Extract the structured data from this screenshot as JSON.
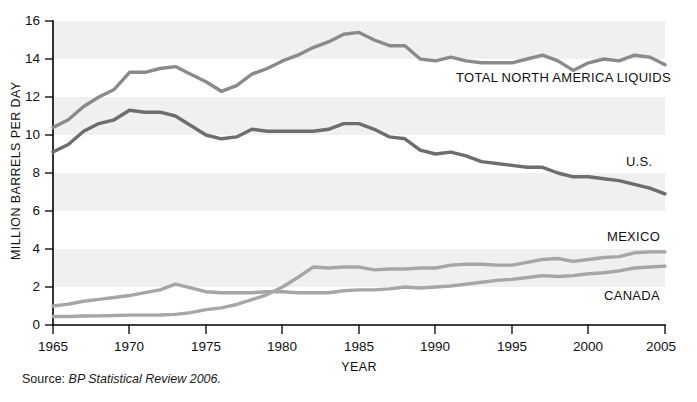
{
  "chart_data": {
    "type": "line",
    "title": "",
    "xlabel": "YEAR",
    "ylabel": "MILLION BARRELS PER DAY",
    "xlim": [
      1965,
      2005
    ],
    "ylim": [
      0,
      16
    ],
    "xticks": [
      1965,
      1970,
      1975,
      1980,
      1985,
      1990,
      1995,
      2000,
      2005
    ],
    "yticks": [
      0,
      2,
      4,
      6,
      8,
      10,
      12,
      14,
      16
    ],
    "grid": false,
    "bands": "alternating light-gray horizontal bands between 2-4, 6-8, 10-12, 14-16",
    "legend_position": "inline labels at right end of each series",
    "x": [
      1965,
      1966,
      1967,
      1968,
      1969,
      1970,
      1971,
      1972,
      1973,
      1974,
      1975,
      1976,
      1977,
      1978,
      1979,
      1980,
      1981,
      1982,
      1983,
      1984,
      1985,
      1986,
      1987,
      1988,
      1989,
      1990,
      1991,
      1992,
      1993,
      1994,
      1995,
      1996,
      1997,
      1998,
      1999,
      2000,
      2001,
      2002,
      2003,
      2004,
      2005
    ],
    "series": [
      {
        "name": "TOTAL NORTH AMERICA LIQUIDS",
        "color": "#8a8a8a",
        "width": 3.4,
        "values": [
          10.4,
          10.8,
          11.5,
          12.0,
          12.4,
          13.3,
          13.3,
          13.5,
          13.6,
          13.2,
          12.8,
          12.3,
          12.6,
          13.2,
          13.5,
          13.9,
          14.2,
          14.6,
          14.9,
          15.3,
          15.4,
          15.0,
          14.7,
          14.7,
          14.0,
          13.9,
          14.1,
          13.9,
          13.8,
          13.8,
          13.8,
          14.0,
          14.2,
          13.9,
          13.4,
          13.8,
          14.0,
          13.9,
          14.2,
          14.1,
          13.7
        ]
      },
      {
        "name": "U.S.",
        "color": "#6d6d6d",
        "width": 3.4,
        "values": [
          9.1,
          9.5,
          10.2,
          10.6,
          10.8,
          11.3,
          11.2,
          11.2,
          11.0,
          10.5,
          10.0,
          9.8,
          9.9,
          10.3,
          10.2,
          10.2,
          10.2,
          10.2,
          10.3,
          10.6,
          10.6,
          10.3,
          9.9,
          9.8,
          9.2,
          9.0,
          9.1,
          8.9,
          8.6,
          8.5,
          8.4,
          8.3,
          8.3,
          8.0,
          7.8,
          7.8,
          7.7,
          7.6,
          7.4,
          7.2,
          6.9
        ]
      },
      {
        "name": "MEXICO",
        "color": "#a6a6a6",
        "width": 3.4,
        "values": [
          0.45,
          0.45,
          0.47,
          0.48,
          0.5,
          0.52,
          0.52,
          0.53,
          0.56,
          0.65,
          0.81,
          0.9,
          1.08,
          1.33,
          1.6,
          2.0,
          2.5,
          3.05,
          3.0,
          3.05,
          3.05,
          2.9,
          2.95,
          2.95,
          3.0,
          3.0,
          3.15,
          3.2,
          3.2,
          3.15,
          3.15,
          3.3,
          3.45,
          3.5,
          3.35,
          3.45,
          3.55,
          3.6,
          3.8,
          3.85,
          3.85
        ]
      },
      {
        "name": "CANADA",
        "color": "#a6a6a6",
        "width": 3.4,
        "values": [
          1.0,
          1.1,
          1.25,
          1.35,
          1.45,
          1.55,
          1.7,
          1.85,
          2.15,
          1.95,
          1.75,
          1.7,
          1.7,
          1.7,
          1.75,
          1.75,
          1.7,
          1.7,
          1.7,
          1.8,
          1.85,
          1.85,
          1.9,
          2.0,
          1.95,
          2.0,
          2.05,
          2.15,
          2.25,
          2.35,
          2.4,
          2.5,
          2.6,
          2.55,
          2.6,
          2.7,
          2.75,
          2.85,
          3.0,
          3.05,
          3.1
        ]
      }
    ],
    "series_labels": [
      {
        "text": "TOTAL NORTH AMERICA LIQUIDS",
        "x": 456,
        "y": 82
      },
      {
        "text": "U.S.",
        "x": 626,
        "y": 166
      },
      {
        "text": "MEXICO",
        "x": 607,
        "y": 241
      },
      {
        "text": "CANADA",
        "x": 604,
        "y": 300
      }
    ],
    "source": {
      "prefix": "Source:",
      "reference": "BP Statistical Review 2006."
    }
  }
}
